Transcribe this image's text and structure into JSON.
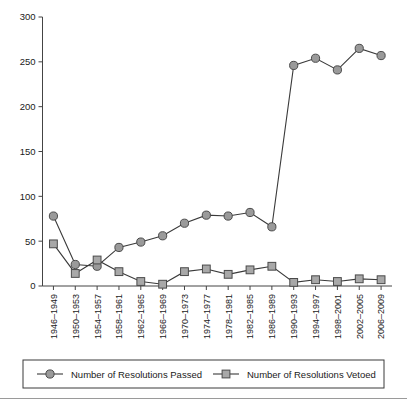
{
  "chart_data": {
    "type": "line",
    "title": "",
    "subtitle": "",
    "xlabel": "",
    "ylabel": "",
    "xlim_categories": 16,
    "ylim": [
      0,
      300
    ],
    "yticks": [
      0,
      50,
      100,
      150,
      200,
      250,
      300
    ],
    "grid": false,
    "legend_position": "bottom",
    "categories": [
      "1946–1949",
      "1950–1953",
      "1954–1957",
      "1958–1961",
      "1962–1965",
      "1966–1969",
      "1970–1973",
      "1974–1977",
      "1978–1981",
      "1982–1985",
      "1986–1989",
      "1990–1993",
      "1994–1997",
      "1998–2001",
      "2002–2005",
      "2006–2009"
    ],
    "series": [
      {
        "name": "Number of Resolutions Passed",
        "marker": "circle",
        "color": "#9a9a9a",
        "values": [
          78,
          24,
          22,
          43,
          49,
          56,
          70,
          79,
          78,
          82,
          66,
          246,
          254,
          241,
          265,
          257
        ]
      },
      {
        "name": "Number of Resolutions Vetoed",
        "marker": "square",
        "color": "#a8a8a8",
        "values": [
          47,
          14,
          29,
          16,
          5,
          2,
          16,
          19,
          13,
          18,
          22,
          4,
          7,
          5,
          8,
          7
        ]
      }
    ]
  },
  "legend": {
    "items": [
      {
        "label": "Number of Resolutions Passed",
        "marker": "circle"
      },
      {
        "label": "Number of Resolutions Vetoed",
        "marker": "square"
      }
    ]
  },
  "axes": {
    "y_tick_labels": [
      "300",
      "250",
      "200",
      "150",
      "100",
      "50",
      "0"
    ]
  }
}
